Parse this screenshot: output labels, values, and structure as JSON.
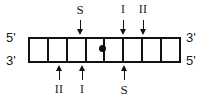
{
  "diagram": {
    "stroke_color": "#111111",
    "text_color": "#1a1a1a",
    "background": "#ffffff",
    "ends": {
      "left_top": "5'",
      "left_bottom": "3'",
      "right_top": "3'",
      "right_bottom": "5'"
    },
    "ladder": {
      "rail_left_x": 28,
      "rail_right_x": 180,
      "rung_count": 9,
      "rung_x": [
        28,
        47,
        66,
        85,
        103,
        122,
        141,
        160,
        179
      ]
    },
    "center_marker": {
      "name": "center-dot",
      "shape": "filled-circle",
      "x": 103,
      "y": 48
    },
    "top_sites": [
      {
        "label": "S",
        "x": 80,
        "arrow": "down"
      },
      {
        "label": "I",
        "x": 123,
        "arrow": "down"
      },
      {
        "label": "II",
        "x": 143,
        "arrow": "down"
      }
    ],
    "bottom_sites": [
      {
        "label": "II",
        "x": 59,
        "arrow": "up"
      },
      {
        "label": "I",
        "x": 82,
        "arrow": "up"
      },
      {
        "label": "S",
        "x": 124,
        "arrow": "up"
      }
    ]
  }
}
